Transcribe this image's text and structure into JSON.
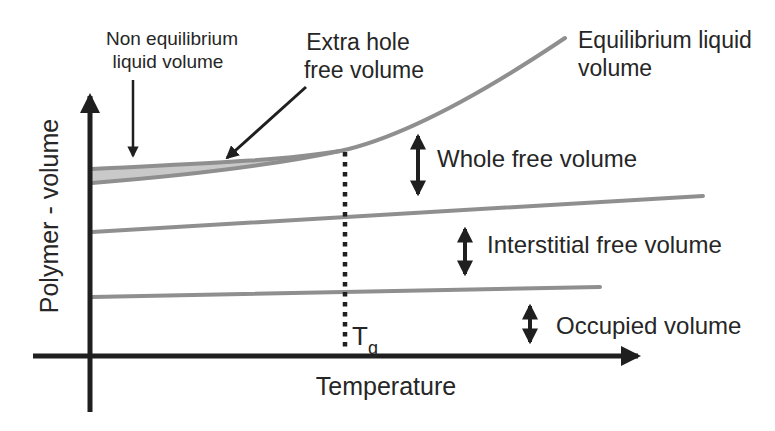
{
  "diagram": {
    "y_axis_label": "Polymer - volume",
    "x_axis_label": "Temperature",
    "tg_label": {
      "symbol": "T",
      "subscript": "g"
    },
    "labels": {
      "non_equilibrium": {
        "line1": "Non equilibrium",
        "line2": "liquid volume"
      },
      "extra_hole": {
        "line1": "Extra hole",
        "line2": "free volume"
      },
      "equilibrium": {
        "line1": "Equilibrium liquid",
        "line2": "volume"
      },
      "whole_free": "Whole free volume",
      "interstitial_free": "Interstitial free volume",
      "occupied": "Occupied volume"
    },
    "colors": {
      "curve_gray": "#8f8f8f",
      "band_fill": "#c9c9c9",
      "ink": "#1f1f1f"
    }
  }
}
